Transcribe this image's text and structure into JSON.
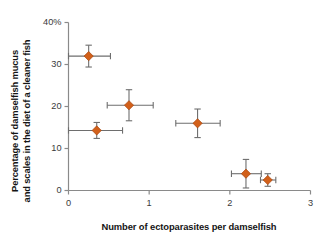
{
  "chart_data": {
    "type": "scatter",
    "title": "",
    "xlabel": "Number of ectoparasites per damselfish",
    "ylabel_line1": "Percentage of damselfish mucus",
    "ylabel_line2": "and scales in the diet of a cleaner fish",
    "xlim": [
      0,
      3
    ],
    "ylim": [
      0,
      40
    ],
    "xticks": [
      0,
      1,
      2,
      3
    ],
    "xtick_labels": [
      "0",
      "1",
      "2",
      "3"
    ],
    "yticks": [
      0,
      10,
      20,
      30,
      40
    ],
    "ytick_labels": [
      "0",
      "10",
      "20",
      "30",
      "40%"
    ],
    "grid": false,
    "legend": "none",
    "marker_color": "#D2601A",
    "marker_edge_color": "#A8430C",
    "errorbar_color": "#6E6E6E",
    "axis_color": "#8A8A8A",
    "points": [
      {
        "x": 0.25,
        "y": 32.0,
        "xerr_low": 0.25,
        "xerr_high": 0.27,
        "yerr": 2.6
      },
      {
        "x": 0.35,
        "y": 14.3,
        "xerr_low": 0.35,
        "xerr_high": 0.32,
        "yerr": 1.9
      },
      {
        "x": 0.75,
        "y": 20.3,
        "xerr_low": 0.27,
        "xerr_high": 0.3,
        "yerr": 3.7
      },
      {
        "x": 1.6,
        "y": 16.0,
        "xerr_low": 0.27,
        "xerr_high": 0.28,
        "yerr": 3.4
      },
      {
        "x": 2.2,
        "y": 4.0,
        "xerr_low": 0.18,
        "xerr_high": 0.19,
        "yerr": 3.4
      },
      {
        "x": 2.47,
        "y": 2.5,
        "xerr_low": 0.09,
        "xerr_high": 0.1,
        "yerr": 1.5
      }
    ]
  }
}
